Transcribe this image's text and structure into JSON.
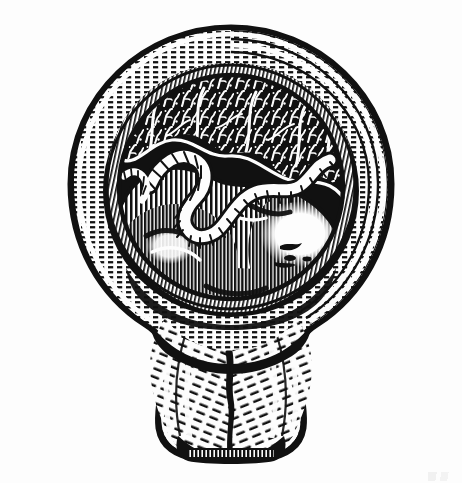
{
  "plate": {
    "title": "Uterus in cross-section at term with fetus and placenta",
    "style": "wood engraving / line-cut medical illustration",
    "background_color": "#fdfdfd",
    "ink_color": "#111111",
    "frame": {
      "present": true,
      "color": "#111111",
      "thickness_px": 2.5,
      "x": 11,
      "y": 10,
      "width": 437,
      "height": 460
    },
    "corner_mark": {
      "present": true,
      "location": "bottom-right, outside frame",
      "legible_text": "",
      "note": "faint illegible smudge"
    }
  },
  "illustration": {
    "subject": "gravid uterus, sagittal section",
    "orientation": "fundus up, cervix down",
    "regions": [
      {
        "id": "outer-myometrium",
        "label": "Outer uterine wall (myometrium)",
        "texture": "dashed stipple bands following the curve",
        "tone": "light"
      },
      {
        "id": "inner-myometrium",
        "label": "Inner uterine wall band",
        "texture": "fine parallel hatch",
        "tone": "mid"
      },
      {
        "id": "placenta",
        "label": "Placenta with chorionic villi",
        "texture": "irregular branching villous stipple",
        "tone": "mottled"
      },
      {
        "id": "amniotic-cavity",
        "label": "Amniotic cavity",
        "texture": "solid fill",
        "tone": "dark"
      },
      {
        "id": "umbilical-cord",
        "label": "Umbilical cord",
        "texture": "coiled ribbon with rung hatching",
        "tone": "light on dark"
      },
      {
        "id": "fetus",
        "label": "Fetus (head and body)",
        "texture": "dense vertical line hatching with white highlights",
        "tone": "mid-dark"
      },
      {
        "id": "lower-segment",
        "label": "Lower uterine segment",
        "texture": "long fibrous diagonal strokes",
        "tone": "light"
      },
      {
        "id": "cervix",
        "label": "Cervix",
        "texture": "fibrous strokes converging on the canal",
        "tone": "light"
      },
      {
        "id": "cervical-canal",
        "label": "Cervical canal",
        "texture": "solid dark line",
        "tone": "dark"
      },
      {
        "id": "external-os",
        "label": "External os",
        "texture": "fine comb hatching",
        "tone": "dark"
      }
    ]
  }
}
